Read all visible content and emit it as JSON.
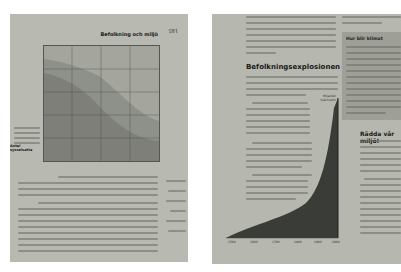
{
  "scene": "Photograph of an open Swedish geography textbook; two pages, left page printed upside down",
  "left_page": {
    "orientation": "upside-down",
    "header": "Befolkning och miljö",
    "page_number": "185",
    "chart": {
      "x_ticks": [
        "2010",
        "1990",
        "1970",
        "1950",
        "1930"
      ],
      "y_ticks": [
        "1",
        "2",
        "3",
        "4",
        "5"
      ],
      "region_labels": [
        "Jordbruk",
        "Industri",
        "Service",
        "Övrigt"
      ],
      "ylabel": "Antal miljoner"
    },
    "caption_title": "Antal sysselsatta"
  },
  "right_page": {
    "heading_1": "Befolkningsexplosionen",
    "sidebar_title": "Hur blir klimat",
    "heading_2": "Rädda vår miljö!",
    "chart": {
      "x_ticks": [
        "1500",
        "1600",
        "1700",
        "1800",
        "1900",
        "2000"
      ],
      "y_ticks": [
        "1",
        "2",
        "3",
        "4",
        "5",
        "6"
      ],
      "label": "Miljarder människor"
    }
  },
  "colors": {
    "paper": "#b8b9b1",
    "chart_fill": "#3a3c38",
    "sidebar_bg": "#9ea097",
    "text": "#1a1a1a"
  }
}
